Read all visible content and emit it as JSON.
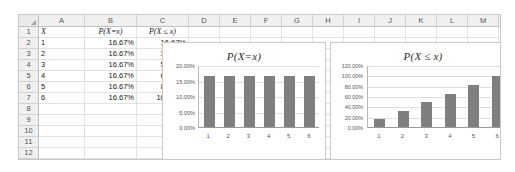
{
  "spreadsheet": {
    "column_headers": [
      "A",
      "B",
      "C",
      "D",
      "E",
      "F",
      "G",
      "H",
      "I",
      "J",
      "K",
      "L",
      "M"
    ],
    "row_headers": [
      "1",
      "2",
      "3",
      "4",
      "5",
      "6",
      "7",
      "8",
      "9",
      "10",
      "11",
      "12"
    ],
    "select_all_icon": "select-all-triangle",
    "header_row": {
      "a": "X",
      "b": "P(X=x)",
      "c": "P(X ≤ x)"
    },
    "rows": [
      {
        "a": "1",
        "b": "16.67%",
        "c": "16.67%"
      },
      {
        "a": "2",
        "b": "16.67%",
        "c": "33.33%"
      },
      {
        "a": "3",
        "b": "16.67%",
        "c": "50.00%"
      },
      {
        "a": "4",
        "b": "16.67%",
        "c": "66.67%"
      },
      {
        "a": "5",
        "b": "16.67%",
        "c": "83.33%"
      },
      {
        "a": "6",
        "b": "16.67%",
        "c": "100.00%"
      }
    ]
  },
  "colors": {
    "bar": "#7f7f7f",
    "gridline": "#e0e0e0",
    "axis": "#9a9a9a",
    "sheet_border": "#c8c8c8",
    "header_fill": "#f0f0f0"
  },
  "chart_data": [
    {
      "type": "bar",
      "id": "pmf",
      "title": "P(X=x)",
      "xlabel": "",
      "ylabel": "",
      "categories": [
        "1",
        "2",
        "3",
        "4",
        "5",
        "6"
      ],
      "values": [
        16.67,
        16.67,
        16.67,
        16.67,
        16.67,
        16.67
      ],
      "ytick_labels": [
        "20.00%",
        "15.00%",
        "10.00%",
        "5.00%",
        "0.00%"
      ],
      "yticks": [
        20,
        15,
        10,
        5,
        0
      ],
      "ylim": [
        0,
        20
      ],
      "grid": true,
      "legend": false
    },
    {
      "type": "bar",
      "id": "cdf",
      "title": "P(X ≤ x)",
      "xlabel": "",
      "ylabel": "",
      "categories": [
        "1",
        "2",
        "3",
        "4",
        "5",
        "6"
      ],
      "values": [
        16.67,
        33.33,
        50.0,
        66.67,
        83.33,
        100.0
      ],
      "ytick_labels": [
        "120.00%",
        "100.00%",
        "80.00%",
        "60.00%",
        "40.00%",
        "20.00%",
        "0.00%"
      ],
      "yticks": [
        120,
        100,
        80,
        60,
        40,
        20,
        0
      ],
      "ylim": [
        0,
        120
      ],
      "grid": true,
      "legend": false
    }
  ]
}
